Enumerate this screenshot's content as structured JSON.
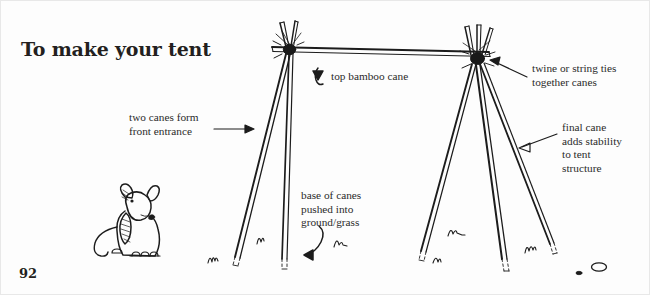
{
  "page": {
    "title": "To make your tent",
    "number": "92",
    "background_color": "#fdfdfd",
    "ink_color": "#1a1a1a",
    "border_color": "#e8e8e8"
  },
  "annotations": [
    {
      "id": "two-canes",
      "text": "two canes form\nfront entrance",
      "arrow": "straight-right"
    },
    {
      "id": "top-cane",
      "text": "top bamboo cane",
      "arrow": "curved-hook-up-left"
    },
    {
      "id": "twine",
      "text": "twine or string ties\ntogether canes",
      "arrow": "straight-left"
    },
    {
      "id": "final-cane",
      "text": "final cane\nadds stability\nto tent\nstructure",
      "arrow": "straight-left"
    },
    {
      "id": "base-of-canes",
      "text": "base of canes\npushed into\nground/grass",
      "arrow": "curved-hook-down-left"
    }
  ],
  "illustration": {
    "name": "hand-drawn-tent-frame",
    "elements": [
      "ridge-pole",
      "left-apex-tie",
      "right-apex-tie",
      "left-front-cane",
      "left-rear-cane",
      "right-cane-a",
      "right-cane-b",
      "right-cane-c",
      "grass-tufts",
      "pebbles",
      "dog"
    ]
  }
}
